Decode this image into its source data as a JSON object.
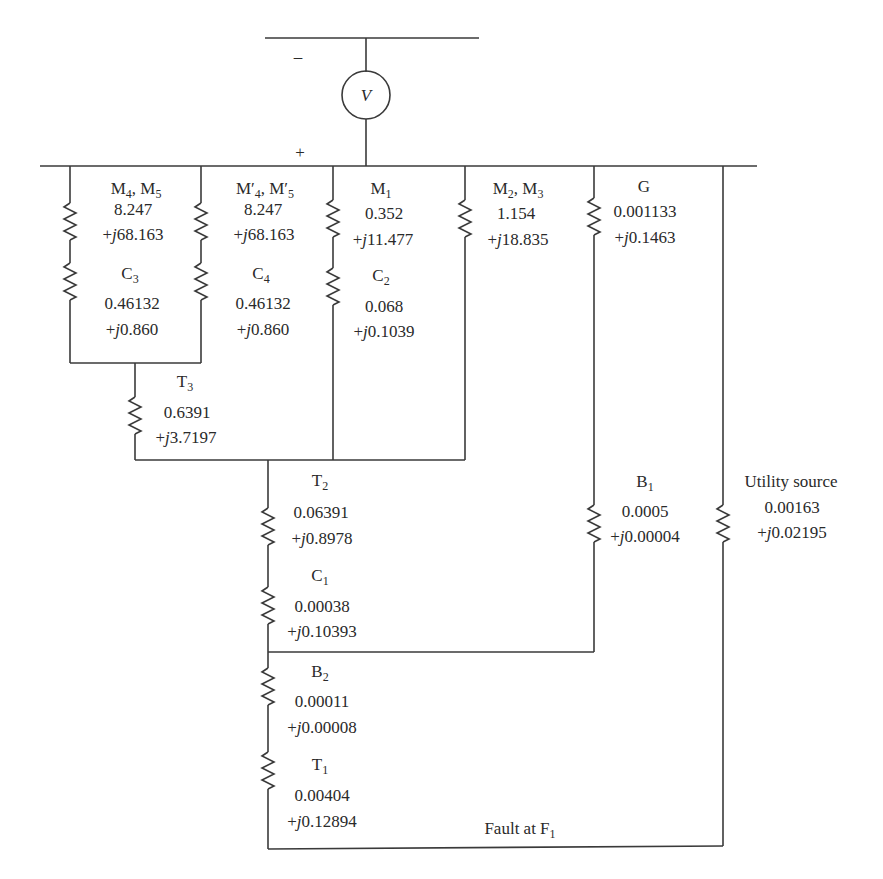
{
  "source": {
    "symbol": "V",
    "minus_label": "–",
    "plus_label": "+"
  },
  "branches": {
    "m4m5": {
      "name": "M",
      "sub1": "4",
      "sep": ", M",
      "sub2": "5",
      "real": "8.247",
      "imag_prefix": "+",
      "j": "j",
      "imag": "68.163"
    },
    "c3": {
      "name": "C",
      "sub": "3",
      "real": "0.46132",
      "imag_prefix": "+",
      "j": "j",
      "imag": "0.860"
    },
    "m4m5_prime": {
      "name": "M′",
      "sub1": "4",
      "sep": ", M′",
      "sub2": "5",
      "real": "8.247",
      "imag_prefix": "+",
      "j": "j",
      "imag": "68.163"
    },
    "c4": {
      "name": "C",
      "sub": "4",
      "real": "0.46132",
      "imag_prefix": "+",
      "j": "j",
      "imag": "0.860"
    },
    "m1": {
      "name": "M",
      "sub": "1",
      "real": "0.352",
      "imag_prefix": "+",
      "j": "j",
      "imag": "11.477"
    },
    "c2": {
      "name": "C",
      "sub": "2",
      "real": "0.068",
      "imag_prefix": "+",
      "j": "j",
      "imag": "0.1039"
    },
    "m2m3": {
      "name": "M",
      "sub1": "2",
      "sep": ", M",
      "sub2": "3",
      "real": "1.154",
      "imag_prefix": "+",
      "j": "j",
      "imag": "18.835"
    },
    "g": {
      "name": "G",
      "real": "0.001133",
      "imag_prefix": "+",
      "j": "j",
      "imag": "0.1463"
    },
    "t3": {
      "name": "T",
      "sub": "3",
      "real": "0.6391",
      "imag_prefix": "+",
      "j": "j",
      "imag": "3.7197"
    },
    "t2": {
      "name": "T",
      "sub": "2",
      "real": "0.06391",
      "imag_prefix": "+",
      "j": "j",
      "imag": "0.8978"
    },
    "c1": {
      "name": "C",
      "sub": "1",
      "real": "0.00038",
      "imag_prefix": "+",
      "j": "j",
      "imag": "0.10393"
    },
    "b1": {
      "name": "B",
      "sub": "1",
      "real": "0.0005",
      "imag_prefix": "+",
      "j": "j",
      "imag": "0.00004"
    },
    "utility": {
      "name": "Utility source",
      "real": "0.00163",
      "imag_prefix": "+",
      "j": "j",
      "imag": "0.02195"
    },
    "b2": {
      "name": "B",
      "sub": "2",
      "real": "0.00011",
      "imag_prefix": "+",
      "j": "j",
      "imag": "0.00008"
    },
    "t1": {
      "name": "T",
      "sub": "1",
      "real": "0.00404",
      "imag_prefix": "+",
      "j": "j",
      "imag": "0.12894"
    }
  },
  "fault": {
    "text": "Fault at F",
    "sub": "1"
  }
}
